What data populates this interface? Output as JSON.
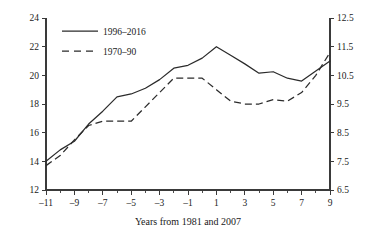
{
  "chart_data": {
    "type": "line",
    "title": "",
    "xlabel": "Years from 1981 and 2007",
    "ylabel": "",
    "ylabel_right": "",
    "xlim": [
      -11,
      9
    ],
    "ylim": [
      12,
      24
    ],
    "ylim_right": [
      6.5,
      12.5
    ],
    "grid": false,
    "legend_position": "top-left",
    "x": [
      -11,
      -10,
      -9,
      -8,
      -7,
      -6,
      -5,
      -4,
      -3,
      -2,
      -1,
      0,
      1,
      2,
      3,
      4,
      5,
      6,
      7,
      8,
      9
    ],
    "xtick_labels": [
      "–11",
      "–9",
      "–7",
      "–5",
      "–3",
      "–1",
      "1",
      "3",
      "5",
      "7",
      "9"
    ],
    "xtick_values": [
      -11,
      -9,
      -7,
      -5,
      -3,
      -1,
      1,
      3,
      5,
      7,
      9
    ],
    "xtick_minor_values": [
      -10,
      -8,
      -6,
      -4,
      -2,
      0,
      2,
      4,
      6,
      8
    ],
    "ytick_left_labels": [
      "12",
      "14",
      "16",
      "18",
      "20",
      "22",
      "24"
    ],
    "ytick_left_values": [
      12,
      14,
      16,
      18,
      20,
      22,
      24
    ],
    "ytick_right_labels": [
      "6.5",
      "7.5",
      "8.5",
      "9.5",
      "10.5",
      "11.5",
      "12.5"
    ],
    "ytick_right_values": [
      6.5,
      7.5,
      8.5,
      9.5,
      10.5,
      11.5,
      12.5
    ],
    "series": [
      {
        "name": "1996–2016",
        "axis": "left",
        "style": "solid",
        "color": "#2b2b2b",
        "values": [
          14.0,
          14.8,
          15.4,
          16.6,
          17.5,
          18.5,
          18.7,
          19.1,
          19.7,
          20.5,
          20.7,
          21.2,
          22.0,
          21.4,
          20.8,
          20.15,
          20.25,
          19.8,
          19.6,
          20.3,
          21.0
        ]
      },
      {
        "name": "1970–90",
        "axis": "right",
        "style": "dashed",
        "color": "#2b2b2b",
        "values": [
          7.35,
          7.7,
          8.25,
          8.75,
          8.9,
          8.9,
          8.9,
          9.4,
          9.9,
          10.4,
          10.4,
          10.4,
          10.0,
          9.6,
          9.5,
          9.5,
          9.65,
          9.6,
          9.9,
          10.5,
          11.3
        ]
      }
    ],
    "legend": [
      {
        "label": "1996–2016",
        "style": "solid"
      },
      {
        "label": "1970–90",
        "style": "dashed"
      }
    ]
  }
}
